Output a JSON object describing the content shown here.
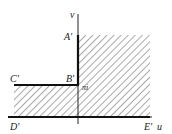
{
  "diagram": {
    "axes": {
      "horizontal_label": "u",
      "vertical_label": "v"
    },
    "points": {
      "A": "A'",
      "B": "B'",
      "C": "C'",
      "D": "D'",
      "E": "E'"
    },
    "value_label": "πi",
    "colors": {
      "ink": "#222222",
      "hatch": "#555555",
      "background": "#ffffff"
    }
  }
}
